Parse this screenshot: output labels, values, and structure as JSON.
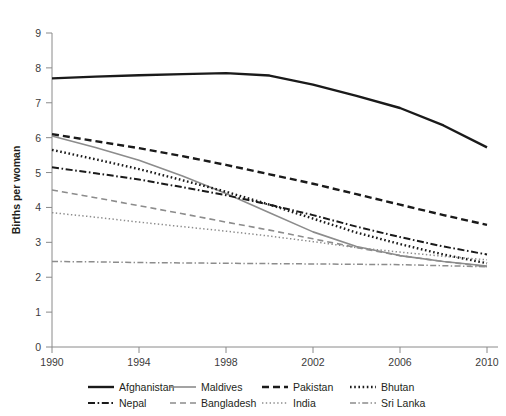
{
  "axes": {
    "ylabel": "Births per woman",
    "yticks": [
      "0",
      "1",
      "2",
      "3",
      "4",
      "5",
      "6",
      "7",
      "8",
      "9"
    ],
    "xticks": [
      "1990",
      "1994",
      "1998",
      "2002",
      "2006",
      "2010"
    ]
  },
  "legend": {
    "row1": [
      {
        "label": "Afghanistan",
        "style": "solid-thick",
        "color": "#1a1a1a"
      },
      {
        "label": "Maldives",
        "style": "solid-gray",
        "color": "#8c8c8c"
      },
      {
        "label": "Pakistan",
        "style": "dashed-thick",
        "color": "#1a1a1a"
      },
      {
        "label": "Bhutan",
        "style": "dotted",
        "color": "#1a1a1a"
      }
    ],
    "row2": [
      {
        "label": "Nepal",
        "style": "dash-dot",
        "color": "#1a1a1a"
      },
      {
        "label": "Bangladesh",
        "style": "dashed-gray",
        "color": "#8c8c8c"
      },
      {
        "label": "India",
        "style": "dotted-light",
        "color": "#8c8c8c"
      },
      {
        "label": "Sri Lanka",
        "style": "dash-dot-gray",
        "color": "#8c8c8c"
      }
    ]
  },
  "chart_data": {
    "type": "line",
    "title": "",
    "xlabel": "",
    "ylabel": "Births per woman",
    "x": [
      1990,
      1992,
      1994,
      1996,
      1998,
      2000,
      2002,
      2004,
      2006,
      2008,
      2010
    ],
    "xlim": [
      1990,
      2010
    ],
    "ylim": [
      0,
      9
    ],
    "grid": false,
    "legend_position": "below",
    "series": [
      {
        "name": "Afghanistan",
        "color": "#1a1a1a",
        "style": "solid-thick",
        "values": [
          7.7,
          7.75,
          7.79,
          7.82,
          7.85,
          7.78,
          7.52,
          7.2,
          6.85,
          6.35,
          5.72
        ]
      },
      {
        "name": "Maldives",
        "color": "#8c8c8c",
        "style": "solid-gray",
        "values": [
          6.05,
          5.72,
          5.35,
          4.9,
          4.4,
          3.85,
          3.3,
          2.88,
          2.62,
          2.45,
          2.32
        ]
      },
      {
        "name": "Pakistan",
        "color": "#1a1a1a",
        "style": "dashed-thick",
        "values": [
          6.1,
          5.9,
          5.7,
          5.47,
          5.22,
          4.95,
          4.68,
          4.38,
          4.08,
          3.78,
          3.5
        ]
      },
      {
        "name": "Bhutan",
        "color": "#1a1a1a",
        "style": "dotted",
        "values": [
          5.65,
          5.38,
          5.1,
          4.78,
          4.45,
          4.08,
          3.68,
          3.28,
          2.95,
          2.65,
          2.4
        ]
      },
      {
        "name": "Nepal",
        "color": "#1a1a1a",
        "style": "dash-dot",
        "values": [
          5.15,
          4.98,
          4.8,
          4.58,
          4.35,
          4.08,
          3.78,
          3.45,
          3.15,
          2.88,
          2.65
        ]
      },
      {
        "name": "Bangladesh",
        "color": "#8c8c8c",
        "style": "dashed-gray",
        "values": [
          4.5,
          4.28,
          4.05,
          3.82,
          3.58,
          3.35,
          3.1,
          2.85,
          2.62,
          2.45,
          2.3
        ]
      },
      {
        "name": "India",
        "color": "#8c8c8c",
        "style": "dotted-light",
        "values": [
          3.85,
          3.72,
          3.58,
          3.45,
          3.32,
          3.18,
          3.02,
          2.85,
          2.72,
          2.6,
          2.5
        ]
      },
      {
        "name": "Sri Lanka",
        "color": "#8c8c8c",
        "style": "dash-dot-gray",
        "values": [
          2.45,
          2.44,
          2.42,
          2.41,
          2.4,
          2.39,
          2.38,
          2.37,
          2.36,
          2.33,
          2.3
        ]
      }
    ]
  }
}
